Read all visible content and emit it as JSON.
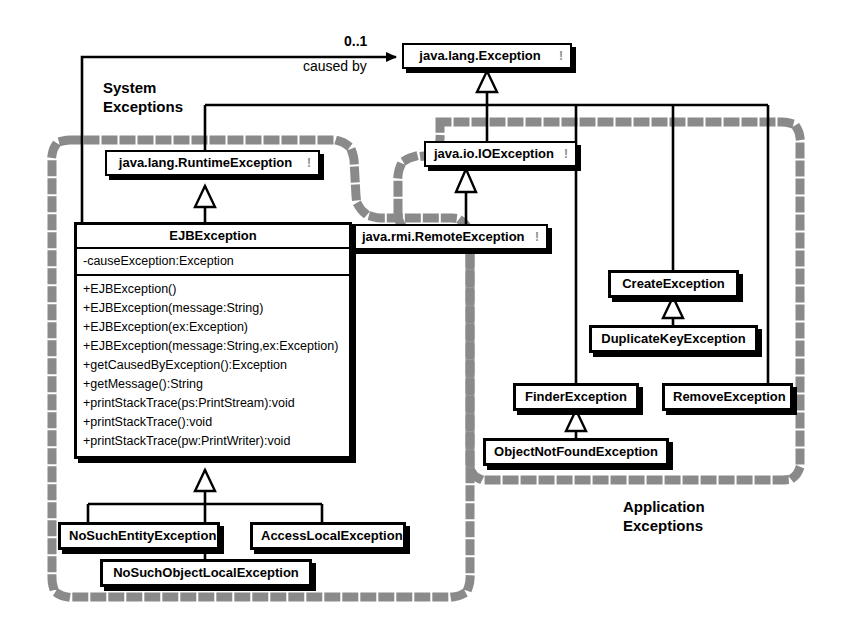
{
  "diagram": {
    "type": "uml-class-diagram",
    "background": "#ffffff",
    "line_color": "#000000",
    "region_dash_color": "#808080"
  },
  "regions": [
    {
      "id": "system",
      "label_line1": "System",
      "label_line2": "Exceptions",
      "style": "dotted-rounded"
    },
    {
      "id": "application",
      "label_line1": "Application",
      "label_line2": "Exceptions",
      "style": "dotted-rounded"
    }
  ],
  "association": {
    "multiplicity": "0..1",
    "name": "caused by"
  },
  "classes": {
    "exception": {
      "name": "java.lang.Exception",
      "marker": "note-icon"
    },
    "runtime_exception": {
      "name": "java.lang.RuntimeException",
      "marker": "note-icon"
    },
    "io_exception": {
      "name": "java.io.IOException",
      "marker": "note-icon"
    },
    "remote_exception": {
      "name": "java.rmi.RemoteException",
      "marker": "note-icon"
    },
    "ejb_exception": {
      "name": "EJBException",
      "attributes": [
        "-causeException:Exception"
      ],
      "operations": [
        "+EJBException()",
        "+EJBException(message:String)",
        "+EJBException(ex:Exception)",
        "+EJBException(message:String,ex:Exception)",
        "+getCausedByException():Exception",
        "+getMessage():String",
        "+printStackTrace(ps:PrintStream):void",
        "+printStackTrace():void",
        "+printStackTrace(pw:PrintWriter):void"
      ]
    },
    "no_such_entity_exception": {
      "name": "NoSuchEntityException"
    },
    "access_local_exception": {
      "name": "AccessLocalException"
    },
    "no_such_object_local_exception": {
      "name": "NoSuchObjectLocalException"
    },
    "create_exception": {
      "name": "CreateException"
    },
    "duplicate_key_exception": {
      "name": "DuplicateKeyException"
    },
    "finder_exception": {
      "name": "FinderException"
    },
    "remove_exception": {
      "name": "RemoveException"
    },
    "object_not_found_exception": {
      "name": "ObjectNotFoundException"
    }
  },
  "relationships": [
    {
      "type": "generalization",
      "from": "java.lang.RuntimeException",
      "to": "java.lang.Exception"
    },
    {
      "type": "generalization",
      "from": "java.io.IOException",
      "to": "java.lang.Exception"
    },
    {
      "type": "generalization",
      "from": "CreateException",
      "to": "java.lang.Exception"
    },
    {
      "type": "generalization",
      "from": "FinderException",
      "to": "java.lang.Exception"
    },
    {
      "type": "generalization",
      "from": "RemoveException",
      "to": "java.lang.Exception"
    },
    {
      "type": "generalization",
      "from": "EJBException",
      "to": "java.lang.RuntimeException"
    },
    {
      "type": "generalization",
      "from": "java.rmi.RemoteException",
      "to": "java.io.IOException"
    },
    {
      "type": "generalization",
      "from": "NoSuchEntityException",
      "to": "EJBException"
    },
    {
      "type": "generalization",
      "from": "AccessLocalException",
      "to": "EJBException"
    },
    {
      "type": "generalization",
      "from": "NoSuchObjectLocalException",
      "to": "EJBException"
    },
    {
      "type": "generalization",
      "from": "DuplicateKeyException",
      "to": "CreateException"
    },
    {
      "type": "generalization",
      "from": "ObjectNotFoundException",
      "to": "FinderException"
    },
    {
      "type": "association",
      "from": "EJBException",
      "to": "java.lang.Exception",
      "label": "caused by",
      "multiplicity": "0..1"
    }
  ]
}
